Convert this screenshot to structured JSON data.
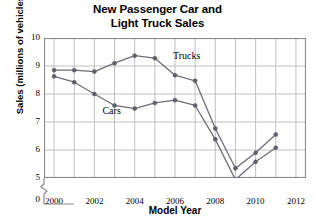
{
  "chart_data": {
    "type": "line",
    "title": "New Passenger Car and Light Truck Sales",
    "title_line1": "New Passenger Car and",
    "title_line2": "Light Truck Sales",
    "xlabel": "Model Year",
    "ylabel": "Sales (millions of vehicles)",
    "x": [
      2000,
      2001,
      2002,
      2003,
      2004,
      2005,
      2006,
      2007,
      2008,
      2009,
      2010,
      2011
    ],
    "xlim": [
      1999.5,
      2012.5
    ],
    "ylim": [
      5,
      10
    ],
    "y_axis_broken": true,
    "y_break_label": "0",
    "xticks": [
      2000,
      2002,
      2004,
      2006,
      2008,
      2010,
      2012
    ],
    "xtick_labels": [
      "2000",
      "2002",
      "2004",
      "2006",
      "2008",
      "2010",
      "2012"
    ],
    "x_gridlines": [
      2000,
      2001,
      2002,
      2003,
      2004,
      2005,
      2006,
      2007,
      2008,
      2009,
      2010,
      2011,
      2012
    ],
    "yticks": [
      5,
      6,
      7,
      8,
      9,
      10
    ],
    "ytick_labels": [
      "5",
      "6",
      "7",
      "8",
      "9",
      "10"
    ],
    "grid": true,
    "legend_position": "inline-annotations",
    "series": [
      {
        "name": "Trucks",
        "color": "#6e6e78",
        "label_x": 2005.9,
        "label_y": 9.35,
        "values": [
          8.85,
          8.85,
          8.8,
          9.1,
          9.37,
          9.28,
          8.67,
          8.47,
          6.77,
          5.35,
          5.9,
          6.55
        ]
      },
      {
        "name": "Cars",
        "color": "#6e6e78",
        "label_x": 2002.4,
        "label_y": 7.4,
        "values": [
          8.63,
          8.42,
          8.0,
          7.59,
          7.48,
          7.68,
          7.78,
          7.59,
          6.38,
          4.94,
          5.58,
          6.08
        ]
      }
    ]
  },
  "style": {
    "plot_border_color": "#8a8a92",
    "grid_color": "#b9b9c0",
    "line_color": "#6e6e78",
    "marker_color": "#5f5f69",
    "text_color": "#000000",
    "background": "#ffffff"
  }
}
